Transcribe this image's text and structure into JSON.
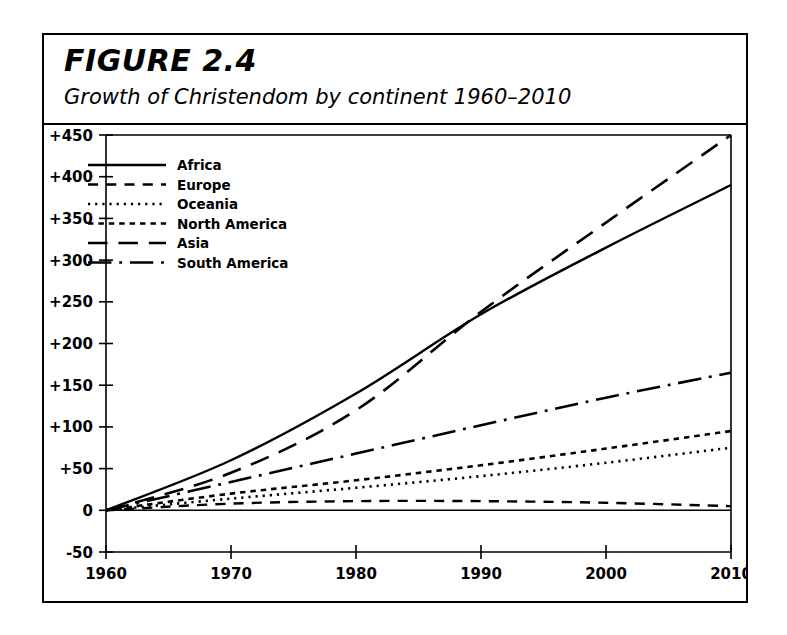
{
  "figure": {
    "title": "FIGURE 2.4",
    "subtitle": "Growth of Christendom by continent 1960–2010"
  },
  "chart_data": {
    "type": "line",
    "title": "FIGURE 2.4",
    "subtitle": "Growth of Christendom by continent 1960–2010",
    "xlabel": "",
    "ylabel": "",
    "x": [
      1960,
      1970,
      1980,
      1990,
      2000,
      2010
    ],
    "xlim": [
      1960,
      2010
    ],
    "ylim": [
      -50,
      450
    ],
    "xticks": [
      1960,
      1970,
      1980,
      1990,
      2000,
      2010
    ],
    "xtick_labels": [
      "1960",
      "1970",
      "1980",
      "1990",
      "2000",
      "2010"
    ],
    "yticks": [
      -50,
      0,
      50,
      100,
      150,
      200,
      250,
      300,
      350,
      400,
      450
    ],
    "ytick_labels": [
      "-50",
      "0",
      "+50",
      "+100",
      "+150",
      "+200",
      "+250",
      "+300",
      "+350",
      "+400",
      "+450"
    ],
    "grid": false,
    "legend_position": "top-left",
    "series": [
      {
        "name": "Africa",
        "dash": "solid",
        "width": 2.4,
        "values": [
          0,
          60,
          140,
          235,
          315,
          390
        ]
      },
      {
        "name": "Europe",
        "dash": "dashed",
        "width": 2.4,
        "values": [
          0,
          8,
          11,
          11,
          9,
          5
        ]
      },
      {
        "name": "Oceania",
        "dash": "dotted",
        "width": 2.6,
        "values": [
          0,
          14,
          27,
          41,
          57,
          75
        ]
      },
      {
        "name": "North America",
        "dash": "small-dash",
        "width": 2.6,
        "values": [
          0,
          20,
          36,
          54,
          74,
          95
        ]
      },
      {
        "name": "Asia",
        "dash": "long-dash",
        "width": 2.6,
        "values": [
          0,
          45,
          120,
          238,
          345,
          450
        ]
      },
      {
        "name": "South America",
        "dash": "dash-dot",
        "width": 2.6,
        "values": [
          0,
          34,
          68,
          102,
          135,
          165
        ]
      }
    ]
  }
}
